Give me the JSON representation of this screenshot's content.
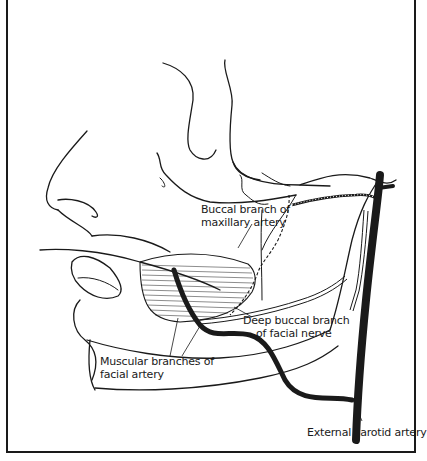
{
  "figure": {
    "colors": {
      "ink": "#1a1a1a",
      "background": "#ffffff"
    },
    "labels": [
      {
        "id": "buccal-branch-maxillary-artery",
        "lines": [
          "Buccal branch of",
          "maxillary artery"
        ]
      },
      {
        "id": "deep-buccal-branch-facial-nerve",
        "lines": [
          "Deep buccal branch",
          "of facial nerve"
        ]
      },
      {
        "id": "muscular-branches-facial-artery",
        "lines": [
          "Muscular branches of",
          "facial artery"
        ]
      },
      {
        "id": "external-carotid-artery",
        "lines": [
          "External carotid artery"
        ]
      }
    ]
  }
}
